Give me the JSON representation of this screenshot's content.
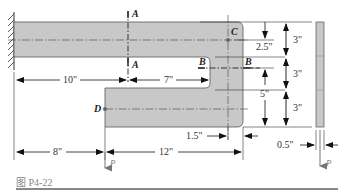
{
  "figure": {
    "caption": "图 P4-22",
    "colors": {
      "part_fill": "#c8c8c8",
      "part_stroke": "#555555",
      "line": "#222222",
      "load_arrow": "#777777"
    }
  },
  "labels": {
    "section_a_top": "A",
    "section_a_bottom": "A",
    "section_b_left": "B",
    "section_b_right": "B",
    "point_c": "C",
    "point_d": "D",
    "load_front": "P",
    "load_side": "P"
  },
  "dimensions": {
    "d10": "10\"",
    "d7": "7\"",
    "d8": "8\"",
    "d12": "12\"",
    "d1_5": "1.5\"",
    "d2_5": "2.5\"",
    "d5": "5\"",
    "d3_top": "3\"",
    "d3_mid": "3\"",
    "d3_bot": "3\"",
    "d0_5": "0.5\""
  }
}
